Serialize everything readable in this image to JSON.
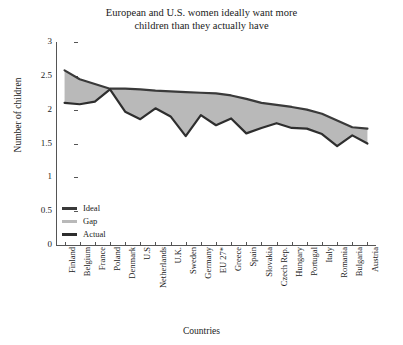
{
  "chart_data": {
    "type": "area",
    "title": "European and U.S. women ideally want more\nchildren than they actually have",
    "xlabel": "Countries",
    "ylabel": "Number of children",
    "ylim": [
      0,
      3
    ],
    "yticks": [
      0,
      0.5,
      1,
      1.5,
      2,
      2.5,
      3
    ],
    "ytick_labels": [
      "0",
      "0.5",
      "1",
      "1.5",
      "2",
      "2.5",
      "3"
    ],
    "grid": false,
    "legend_position": "lower-left-inside",
    "categories": [
      "Finland",
      "Belgium",
      "France",
      "Poland",
      "Denmark",
      "U.S",
      "Netherlands",
      "U.K.",
      "Sweden",
      "Germany",
      "EU 27*",
      "Greece",
      "Spain",
      "Slovakia",
      "Czech Rep.",
      "Hungary",
      "Portugal",
      "Italy",
      "Romania",
      "Bulgaria",
      "Austria"
    ],
    "series": [
      {
        "name": "Ideal",
        "color": "#3a3a3a",
        "values": [
          2.58,
          2.45,
          2.38,
          2.31,
          2.31,
          2.3,
          2.28,
          2.27,
          2.26,
          2.25,
          2.24,
          2.21,
          2.16,
          2.1,
          2.07,
          2.04,
          2.0,
          1.94,
          1.84,
          1.74,
          1.72
        ]
      },
      {
        "name": "Actual",
        "color": "#2e2e2e",
        "values": [
          2.1,
          2.08,
          2.12,
          2.3,
          1.97,
          1.86,
          2.02,
          1.9,
          1.61,
          1.92,
          1.77,
          1.87,
          1.65,
          1.73,
          1.8,
          1.73,
          1.72,
          1.64,
          1.46,
          1.62,
          1.5
        ]
      }
    ],
    "gap_band": {
      "name": "Gap",
      "color": "#b9b9b9",
      "description": "Shaded area between Ideal and Actual"
    },
    "footnote": "EU 27*"
  },
  "legend": {
    "items": [
      {
        "label": "Ideal",
        "color": "#3a3a3a"
      },
      {
        "label": "Gap",
        "color": "#b9b9b9"
      },
      {
        "label": "Actual",
        "color": "#2e2e2e"
      }
    ]
  }
}
